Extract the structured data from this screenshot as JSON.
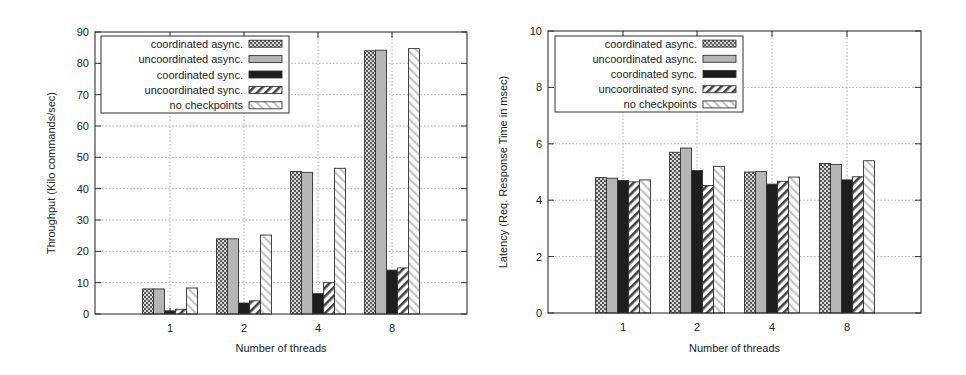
{
  "chart_data": [
    {
      "type": "bar",
      "title": "",
      "xlabel": "Number of threads",
      "ylabel": "Throughput (Kilo commands/sec)",
      "categories": [
        "1",
        "2",
        "4",
        "8"
      ],
      "ylim": [
        0,
        90
      ],
      "yticks": [
        0,
        10,
        20,
        30,
        40,
        50,
        60,
        70,
        80,
        90
      ],
      "grid": true,
      "legend_position": "upper-left",
      "series": [
        {
          "name": "coordinated async.",
          "pattern": "checker",
          "values": [
            8,
            24,
            45.5,
            84
          ]
        },
        {
          "name": "uncoordinated async.",
          "pattern": "gray",
          "values": [
            8,
            24,
            45.2,
            84.2
          ]
        },
        {
          "name": "coordinated sync.",
          "pattern": "black",
          "values": [
            1,
            3.5,
            6.5,
            14
          ]
        },
        {
          "name": "uncoordinated sync.",
          "pattern": "hatch-back",
          "values": [
            1.5,
            4.2,
            10,
            14.7
          ]
        },
        {
          "name": "no checkpoints",
          "pattern": "hatch-light",
          "values": [
            8.3,
            25.2,
            46.5,
            84.7
          ]
        }
      ]
    },
    {
      "type": "bar",
      "title": "",
      "xlabel": "Number of threads",
      "ylabel": "Latency (Req. Response Time in msec)",
      "categories": [
        "1",
        "2",
        "4",
        "8"
      ],
      "ylim": [
        0,
        10
      ],
      "yticks": [
        0,
        2,
        4,
        6,
        8,
        10
      ],
      "grid": true,
      "legend_position": "upper-left",
      "series": [
        {
          "name": "coordinated async.",
          "pattern": "checker",
          "values": [
            4.8,
            5.7,
            5.0,
            5.3
          ]
        },
        {
          "name": "uncoordinated async.",
          "pattern": "gray",
          "values": [
            4.78,
            5.85,
            5.02,
            5.27
          ]
        },
        {
          "name": "coordinated sync.",
          "pattern": "black",
          "values": [
            4.7,
            5.05,
            4.57,
            4.72
          ]
        },
        {
          "name": "uncoordinated sync.",
          "pattern": "hatch-back",
          "values": [
            4.65,
            4.52,
            4.67,
            4.83
          ]
        },
        {
          "name": "no checkpoints",
          "pattern": "hatch-light",
          "values": [
            4.72,
            5.2,
            4.82,
            5.4
          ]
        }
      ]
    }
  ],
  "layout": [
    {
      "plot": {
        "x0": 95,
        "x1": 467,
        "y0": 314,
        "y1": 32
      },
      "group_centers": [
        170,
        244,
        318,
        392
      ],
      "legend": {
        "x": 101,
        "y": 36,
        "w": 188,
        "h": 77
      },
      "ylabel_x": 55,
      "xlabel_y": 352
    },
    {
      "plot": {
        "x0": 548,
        "x1": 921,
        "y0": 313,
        "y1": 31
      },
      "group_centers": [
        623,
        697,
        772,
        847
      ],
      "legend": {
        "x": 555,
        "y": 36,
        "w": 188,
        "h": 76
      },
      "ylabel_x": 507,
      "xlabel_y": 352
    }
  ],
  "colors": {
    "axis": "#333333",
    "grid": "#9a9a9a",
    "checker_fg": "#555555",
    "checker_bg": "#d8d8d8",
    "gray": "#b5b5b5",
    "black": "#1e1e1e",
    "hatch_dark": "#444444",
    "hatch_light": "#bdbdbd"
  }
}
